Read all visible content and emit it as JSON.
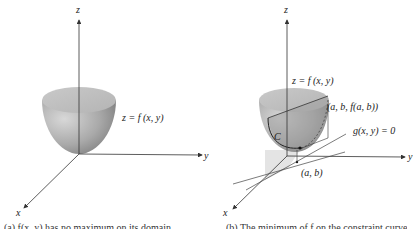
{
  "panel_a": {
    "axis_z": "z",
    "axis_y": "y",
    "axis_x": "x",
    "surface_label": "z = f (x, y)",
    "caption": "(a) f(x, y) has no maximum on its domain"
  },
  "panel_b": {
    "axis_z": "z",
    "axis_y": "y",
    "axis_x": "x",
    "surface_label": "z = f (x, y)",
    "point_label": "(a, b, f(a, b))",
    "curve_label": "C",
    "constraint_label": "g(x, y) = 0",
    "base_point_label": "(a, b)",
    "caption": "(b) The minimum of f on the constraint curve"
  },
  "colors": {
    "axis": "#333333",
    "surface_dark": "#8a8a8a",
    "surface_light": "#d4d4d4",
    "top_face": "#bdbdbd",
    "shadow": "#e6e6e6"
  }
}
